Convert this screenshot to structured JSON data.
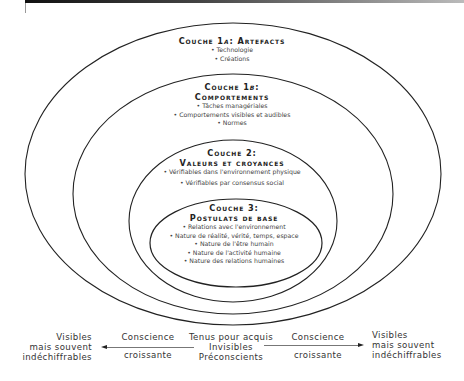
{
  "layers": [
    {
      "id": "1a",
      "title_prefix": "Couche 1",
      "title_italic": "a",
      "title_suffix": ": Artefacts",
      "items": [
        "• Technologie",
        "• Créations"
      ]
    },
    {
      "id": "1b",
      "title_line1_prefix": "Couche 1",
      "title_line1_italic": "b",
      "title_line1_suffix": ":",
      "title_line2": "Comportements",
      "items": [
        "• Tâches managériales",
        "• Comportements visibles et audibles",
        "• Normes"
      ]
    },
    {
      "id": "2",
      "title_line1": "Couche 2:",
      "title_line2": "Valeurs et croyances",
      "items": [
        "• Vérifiables dans l'environnement physique",
        "• Vérifiables par consensus social"
      ]
    },
    {
      "id": "3",
      "title_line1": "Couche 3:",
      "title_line2": "Postulats de base",
      "items": [
        "• Relations avec l'environnement",
        "• Nature de réalité, vérité, temps, espace",
        "• Nature de l'être humain",
        "• Nature de l'activité humaine",
        "• Nature des relations humaines"
      ]
    }
  ],
  "footer": {
    "left": {
      "line1": "Visibles",
      "line2": "mais souvent",
      "line3": "indéchiffrables"
    },
    "left_arrow": {
      "line1": "Conscience",
      "line2": "croissante"
    },
    "center": {
      "line1": "Tenus pour acquis",
      "line2": "Invisibles",
      "line3": "Préconscients"
    },
    "right_arrow": {
      "line1": "Conscience",
      "line2": "croissante"
    },
    "right": {
      "line1": "Visibles",
      "line2": "mais souvent",
      "line3": "indéchiffrables"
    }
  },
  "colors": {
    "stroke": "#222222",
    "text": "#333333",
    "arrow": "#777777"
  }
}
